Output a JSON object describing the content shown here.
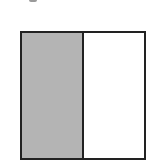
{
  "diagram": {
    "type": "fraction-model",
    "total_parts": 2,
    "shaded_parts": 1,
    "parts": [
      {
        "index": 0,
        "shaded": true,
        "color": "#b4b4b4"
      },
      {
        "index": 1,
        "shaded": false,
        "color": "#ffffff"
      }
    ],
    "border_color": "#222222"
  }
}
